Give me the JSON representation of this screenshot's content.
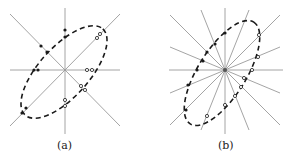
{
  "figure": {
    "panels": [
      {
        "id": "a",
        "caption": "(a)",
        "center": [
          65,
          70
        ],
        "line_count": 4,
        "line_angles_deg": [
          0,
          45,
          90,
          135
        ],
        "ellipse": {
          "rx": 52,
          "ry": 22,
          "rotation_deg": -45,
          "style": "dashed"
        },
        "markers": {
          "filled": "left/upper arc intersections",
          "open": "right/lower arc intersections"
        }
      },
      {
        "id": "b",
        "caption": "(b)",
        "center": [
          225,
          70
        ],
        "line_count": 8,
        "line_angles_deg": [
          0,
          22.5,
          45,
          67.5,
          90,
          112.5,
          135,
          157.5
        ],
        "ellipse": {
          "rx": 52,
          "ry": 22,
          "rotation_deg": -55,
          "style": "dashed"
        },
        "markers": {
          "filled": "left/upper arc intersections",
          "open": "right/lower arc intersections"
        }
      }
    ],
    "colors": {
      "lines": "#9a9a9a",
      "ellipse": "#1a1a1a",
      "markers": "#1a1a1a",
      "background": "#ffffff"
    }
  }
}
